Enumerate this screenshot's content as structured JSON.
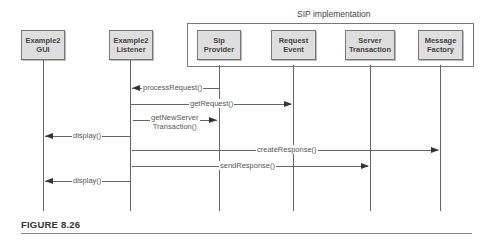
{
  "frame": {
    "title": "SIP implementation"
  },
  "objects": [
    {
      "id": "gui",
      "label": "Example2\nGUI"
    },
    {
      "id": "listener",
      "label": "Example2\nListener"
    },
    {
      "id": "sipprovider",
      "label": "Sip\nProvider"
    },
    {
      "id": "requestevent",
      "label": "Request\nEvent"
    },
    {
      "id": "servertx",
      "label": "Server\nTransaction"
    },
    {
      "id": "msgfactory",
      "label": "Message\nFactory"
    }
  ],
  "messages": [
    {
      "label": "processRequest()",
      "from": "Sip Provider",
      "to": "Example2 Listener"
    },
    {
      "label": "getRequest()",
      "from": "Example2 Listener",
      "to": "Request Event"
    },
    {
      "label": "getNewServer\nTransaction()",
      "from": "Example2 Listener",
      "to": "Sip Provider"
    },
    {
      "label": "display()",
      "from": "Example2 Listener",
      "to": "Example2 GUI"
    },
    {
      "label": "createResponse()",
      "from": "Example2 Listener",
      "to": "Message Factory"
    },
    {
      "label": "sendResponse()",
      "from": "Example2 Listener",
      "to": "Server Transaction"
    },
    {
      "label": "display()",
      "from": "Example2 Listener",
      "to": "Example2 GUI"
    }
  ],
  "caption": "FIGURE 8.26"
}
